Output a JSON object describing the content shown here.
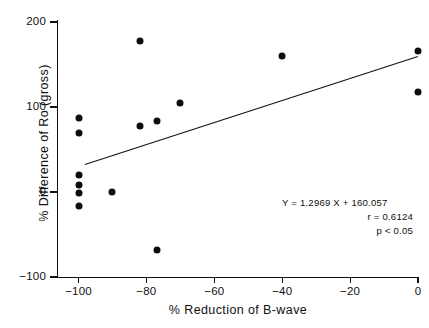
{
  "chart_data": {
    "type": "scatter",
    "title": "",
    "xlabel": "% Reduction of B-wave",
    "ylabel": "% Difference of Ro (gross)",
    "xlim": [
      -105,
      2
    ],
    "ylim": [
      -100,
      200
    ],
    "xticks": [
      -100,
      -80,
      -60,
      -40,
      -20,
      0
    ],
    "xticklabels": [
      "-100",
      "-80",
      "-60",
      "-40",
      "-20",
      "0"
    ],
    "yticks": [
      -100,
      0,
      100,
      200
    ],
    "yticklabels": [
      "-100",
      "0",
      "100",
      "200"
    ],
    "grid": false,
    "legend": null,
    "points": [
      {
        "x": -100,
        "y": 87
      },
      {
        "x": -100,
        "y": 70
      },
      {
        "x": -100,
        "y": 20
      },
      {
        "x": -100,
        "y": 8
      },
      {
        "x": -100,
        "y": -1
      },
      {
        "x": -100,
        "y": -16
      },
      {
        "x": -90,
        "y": 0
      },
      {
        "x": -82,
        "y": 178
      },
      {
        "x": -82,
        "y": 78
      },
      {
        "x": -77,
        "y": 84
      },
      {
        "x": -77,
        "y": -68
      },
      {
        "x": -70,
        "y": 105
      },
      {
        "x": -40,
        "y": 160
      },
      {
        "x": 0,
        "y": 166
      },
      {
        "x": 0,
        "y": 118
      }
    ],
    "fit_line": {
      "slope": 1.2969,
      "intercept": 160.057,
      "x_start": -98,
      "x_end": 0,
      "y_start": 33,
      "y_end": 160
    },
    "annotation": {
      "equation": "Y = 1.2969 X + 160.057",
      "correlation": "r = 0.6124",
      "pvalue": "p < 0.05"
    }
  }
}
